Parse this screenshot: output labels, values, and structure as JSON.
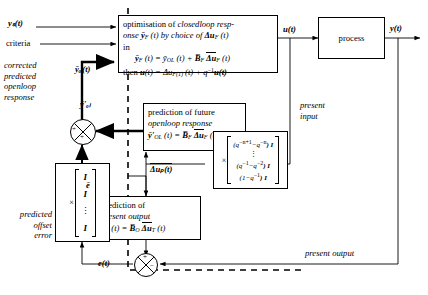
{
  "diagram": {
    "signals": {
      "setpoint": "yₛ(t)",
      "criteria": "criteria",
      "control_input": "u(t)",
      "plant_output": "y(t)",
      "corrected_openloop": "ȳₒₗ(t)",
      "predicted_openloop": "ȳ'ₒₗ",
      "offset_error": "ē",
      "error_signal": "e(t)",
      "future_increments": "Δuₚ(t)"
    },
    "labels": {
      "corrected_predicted_openloop_response": [
        "corrected",
        "predicted",
        "openloop",
        "response"
      ],
      "predicted_offset_error": [
        "predicted",
        "offset",
        "error"
      ],
      "present_input": [
        "present",
        "input"
      ],
      "present_output": "present output"
    },
    "blocks": {
      "optimisation": {
        "name": "optimisation-block",
        "line1_a": "optimisation of ",
        "line1_b": "closedloop resp-",
        "line2_a": "onse ",
        "line2_b": "ȳ",
        "line2_sub": "F",
        "line2_c": " (t) by choice of ",
        "line2_d": "Δu",
        "line2_sub2": "F",
        "line2_e": " (t)",
        "line3": "in",
        "eq1_lhs": "ȳ",
        "eq1_lhs_sub": "F",
        "eq1_mid": " (t) = ȳ",
        "eq1_mid_sub": "OL",
        "eq1_rhs": " (t) + ",
        "eq1_B": "B̅",
        "eq1_B_sub": "F",
        "eq1_du": "Δu",
        "eq1_du_sub": "F",
        "eq1_tail": " (t)",
        "eq2_then": "then ",
        "eq2_u": "u",
        "eq2_eq": "(t) = Δu",
        "eq2_sub": "F(1)",
        "eq2_mid": " (t) + q",
        "eq2_sup": "−1",
        "eq2_tail": "u(t)"
      },
      "prediction_future": {
        "name": "prediction-future-openloop-block",
        "line1": "prediction of future",
        "line2": "openloop response",
        "eq_lhs": "ȳ'",
        "eq_lhs_sub": "OL",
        "eq_mid": " (t) = ",
        "eq_B": "B̅",
        "eq_B_sub": "F",
        "eq_du": "Δu",
        "eq_du_sub": "F",
        "eq_tail": " (t)"
      },
      "prediction_present": {
        "name": "prediction-present-output-block",
        "line1": "prediction of",
        "line2": "present output",
        "eq_lhs": "y",
        "eq_lhs_sub": "O",
        "eq_mid": " (t) = ",
        "eq_B": "B̅",
        "eq_B_sub": "O",
        "eq_du": "Δu",
        "eq_du_sub": "T",
        "eq_tail": " (t)"
      },
      "process": {
        "name": "process-block",
        "label": "process"
      },
      "q_matrix": {
        "name": "q-matrix-block",
        "times": "×",
        "rows": [
          "[(q⁻ⁿ⁺¹ − q⁻ⁿ) I]",
          "⋮",
          "(q⁻¹ − q⁻²) I",
          "(1 − q⁻¹) I"
        ],
        "row1_pre": "(q",
        "row1_sup1": "−n+1",
        "row1_mid": "−q",
        "row1_sup2": "−n",
        "row1_post": ") I",
        "row3_pre": "(q",
        "row3_sup1": "−1",
        "row3_mid": "−q",
        "row3_sup2": "−2",
        "row3_post": ") I",
        "row4": "(1−q",
        "row4_sup": "−1",
        "row4_post": ") I",
        "dots": "⋮"
      },
      "identity_stack": {
        "name": "identity-stack-block",
        "times": "×",
        "rows": [
          "I",
          "I",
          "⋮",
          "I"
        ]
      }
    },
    "sum_junctions": {
      "top": {
        "name": "summing-junction-openloop",
        "signs": [
          "+",
          "+"
        ]
      },
      "bottom": {
        "name": "summing-junction-error",
        "signs": [
          "+",
          "−"
        ]
      }
    }
  }
}
